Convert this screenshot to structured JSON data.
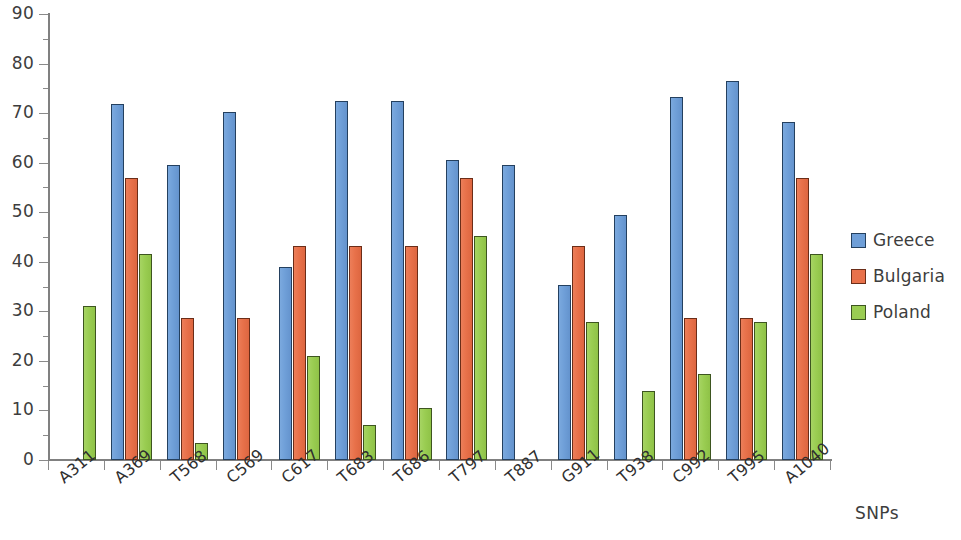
{
  "chart_data": {
    "type": "bar",
    "title": "",
    "subtitle": "",
    "xlabel": "SNPs",
    "ylabel": "",
    "ylim": [
      0,
      90
    ],
    "y_tick_step": 10,
    "y_minor_tick_step": 5,
    "grid": false,
    "legend_position": "right",
    "y_ticks": [
      "0",
      "10",
      "20",
      "30",
      "40",
      "50",
      "60",
      "70",
      "80",
      "90"
    ],
    "categories": [
      "A311",
      "A369",
      "T568",
      "C569",
      "C617",
      "T683",
      "T686",
      "T797",
      "T887",
      "G911",
      "T938",
      "C992",
      "T995",
      "A1040"
    ],
    "series": [
      {
        "name": "Greece",
        "color": "#6f9fd8",
        "values": [
          null,
          71.8,
          59.5,
          70.2,
          39.0,
          72.5,
          72.5,
          60.5,
          59.5,
          35.3,
          49.5,
          73.3,
          76.5,
          68.3
        ]
      },
      {
        "name": "Bulgaria",
        "color": "#e8714a",
        "values": [
          null,
          57.0,
          28.7,
          28.7,
          43.2,
          43.2,
          43.2,
          57.0,
          null,
          43.2,
          null,
          28.7,
          28.7,
          57.0
        ]
      },
      {
        "name": "Poland",
        "color": "#9acd52",
        "values": [
          31.1,
          41.5,
          3.5,
          null,
          21.0,
          7.1,
          10.5,
          45.2,
          null,
          27.8,
          13.9,
          17.3,
          27.8,
          41.5
        ]
      }
    ]
  },
  "legend": {
    "items": [
      {
        "label": "Greece",
        "key": "greece"
      },
      {
        "label": "Bulgaria",
        "key": "bulgaria"
      },
      {
        "label": "Poland",
        "key": "poland"
      }
    ]
  }
}
